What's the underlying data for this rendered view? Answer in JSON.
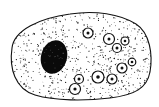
{
  "diagram": {
    "colors": {
      "background": "#ffffff",
      "outline": "#111111",
      "nucleus": "#0a0a0a",
      "stipple": "#222222"
    },
    "cell": {
      "outline_path": "M 12 48 C 14 30, 40 18, 70 14 C 95 10, 120 14, 136 24 C 150 33, 153 55, 150 72 C 147 88, 135 95, 110 98 C 85 101, 55 101, 35 95 C 15 89, 9 68, 12 48 Z"
    },
    "nucleus": {
      "cx": 54,
      "cy": 57,
      "rx": 13,
      "ry": 17,
      "rotate": 15
    },
    "vacuoles": [
      {
        "cx": 88,
        "cy": 33,
        "r": 5,
        "dot": 1.5
      },
      {
        "cx": 109,
        "cy": 39,
        "r": 5.5,
        "dot": 1.5
      },
      {
        "cx": 117,
        "cy": 48,
        "r": 4.5,
        "dot": 1.5
      },
      {
        "cx": 125,
        "cy": 41,
        "r": 4,
        "dot": 1.3
      },
      {
        "cx": 122,
        "cy": 68,
        "r": 5,
        "dot": 1.5
      },
      {
        "cx": 132,
        "cy": 62,
        "r": 3.8,
        "dot": 1.3
      },
      {
        "cx": 79,
        "cy": 79,
        "r": 4.5,
        "dot": 1.5
      },
      {
        "cx": 75,
        "cy": 89,
        "r": 5.5,
        "dot": 1.6
      },
      {
        "cx": 98,
        "cy": 77,
        "r": 6,
        "dot": 1.8
      },
      {
        "cx": 112,
        "cy": 79,
        "r": 5,
        "dot": 1.5
      }
    ]
  }
}
